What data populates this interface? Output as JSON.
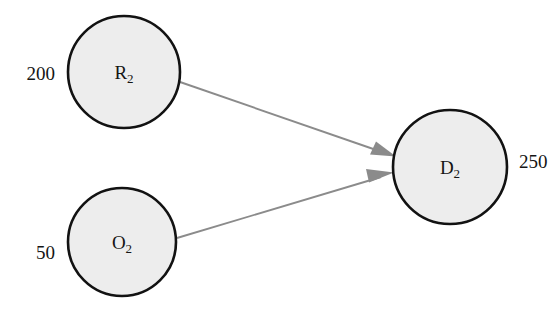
{
  "diagram": {
    "type": "flow-network",
    "background_color": "#ffffff",
    "node_fill_color": "#ededed",
    "node_stroke_color": "#121212",
    "arrow_color": "#8b8b8b",
    "nodes": [
      {
        "id": "R2",
        "base": "R",
        "subscript": "2",
        "value": "200",
        "value_side": "left",
        "cx": 124,
        "cy": 72,
        "r": 56
      },
      {
        "id": "O2",
        "base": "O",
        "subscript": "2",
        "value": "50",
        "value_side": "left",
        "cx": 122,
        "cy": 242,
        "r": 54
      },
      {
        "id": "D2",
        "base": "D",
        "subscript": "2",
        "value": "250",
        "value_side": "right",
        "cx": 450,
        "cy": 167,
        "r": 57
      }
    ],
    "edges": [
      {
        "id": "R2-to-D2",
        "from": "R2",
        "to": "D2"
      },
      {
        "id": "O2-to-D2",
        "from": "O2",
        "to": "D2"
      }
    ]
  }
}
